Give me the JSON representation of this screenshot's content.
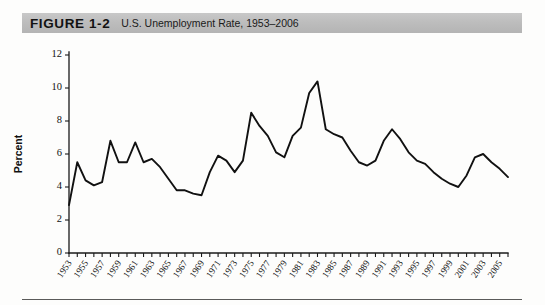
{
  "figure": {
    "label": "FIGURE 1-2",
    "title": "U.S. Unemployment Rate, 1953–2006"
  },
  "chart_data": {
    "type": "line",
    "title": "U.S. Unemployment Rate, 1953–2006",
    "xlabel": "",
    "ylabel": "Percent",
    "ylim": [
      0,
      12
    ],
    "ytick_values": [
      0,
      2,
      4,
      6,
      8,
      10,
      12
    ],
    "xlim": [
      1953,
      2006
    ],
    "xtick_labels": [
      "1953",
      "1955",
      "1957",
      "1959",
      "1961",
      "1963",
      "1965",
      "1967",
      "1969",
      "1971",
      "1973",
      "1975",
      "1977",
      "1979",
      "1981",
      "1983",
      "1985",
      "1987",
      "1989",
      "1991",
      "1993",
      "1995",
      "1997",
      "1999",
      "2001",
      "2003",
      "2005"
    ],
    "grid": false,
    "legend": false,
    "series_name": "Unemployment rate",
    "line_color": "#111111",
    "x": [
      1953,
      1954,
      1955,
      1956,
      1957,
      1958,
      1959,
      1960,
      1961,
      1962,
      1963,
      1964,
      1965,
      1966,
      1967,
      1968,
      1969,
      1970,
      1971,
      1972,
      1973,
      1974,
      1975,
      1976,
      1977,
      1978,
      1979,
      1980,
      1981,
      1982,
      1983,
      1984,
      1985,
      1986,
      1987,
      1988,
      1989,
      1990,
      1991,
      1992,
      1993,
      1994,
      1995,
      1996,
      1997,
      1998,
      1999,
      2000,
      2001,
      2002,
      2003,
      2004,
      2005,
      2006
    ],
    "values": [
      2.9,
      5.5,
      4.4,
      4.1,
      4.3,
      6.8,
      5.5,
      5.5,
      6.7,
      5.5,
      5.7,
      5.2,
      4.5,
      3.8,
      3.8,
      3.6,
      3.5,
      4.9,
      5.9,
      5.6,
      4.9,
      5.6,
      8.5,
      7.7,
      7.1,
      6.1,
      5.8,
      7.1,
      7.6,
      9.7,
      10.4,
      7.5,
      7.2,
      7.0,
      6.2,
      5.5,
      5.3,
      5.6,
      6.8,
      7.5,
      6.9,
      6.1,
      5.6,
      5.4,
      4.9,
      4.5,
      4.2,
      4.0,
      4.7,
      5.8,
      6.0,
      5.5,
      5.1,
      4.6
    ]
  }
}
